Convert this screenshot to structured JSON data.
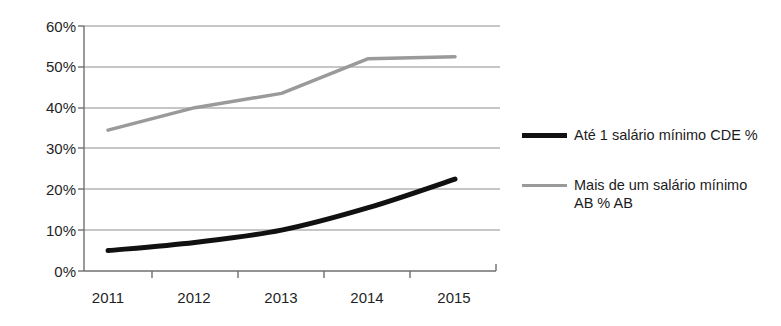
{
  "chart_data": {
    "type": "line",
    "title": "",
    "xlabel": "",
    "ylabel": "",
    "categories": [
      "2011",
      "2012",
      "2013",
      "2014",
      "2015"
    ],
    "x_tick_labels": [
      "2011",
      "2012",
      "2013",
      "2014",
      "2015"
    ],
    "y_tick_labels": [
      "0%",
      "10%",
      "20%",
      "30%",
      "40%",
      "50%",
      "60%"
    ],
    "y_ticks": [
      0,
      10,
      20,
      30,
      40,
      50,
      60
    ],
    "ylim": [
      0,
      60
    ],
    "grid": "horizontal",
    "legend_position": "right",
    "series": [
      {
        "name": "Até 1 salário mínimo  CDE %",
        "color": "#111111",
        "line_width": 5,
        "smooth": true,
        "values": [
          5,
          7,
          10,
          15.5,
          22.5
        ]
      },
      {
        "name": "Mais de um salário mínimo AB % AB",
        "color": "#9a9a9a",
        "line_width": 3.5,
        "smooth": false,
        "values": [
          34.5,
          40,
          43.5,
          52,
          52.5
        ]
      }
    ]
  },
  "legend": {
    "items": [
      {
        "label": "Até 1 salário mínimo  CDE %",
        "swatch": "dark"
      },
      {
        "label": "Mais de um salário mínimo\nAB % AB",
        "swatch": "grey"
      }
    ]
  },
  "axis": {
    "y_labels": [
      "60%",
      "50%",
      "40%",
      "30%",
      "20%",
      "10%",
      "0%"
    ],
    "x_labels": [
      "2011",
      "2012",
      "2013",
      "2014",
      "2015"
    ]
  },
  "colors": {
    "series_dark": "#111111",
    "series_grey": "#9a9a9a",
    "grid": "#8d8d8d",
    "axis": "#6f6f6f",
    "text": "#1c1c1c",
    "background": "#ffffff"
  }
}
